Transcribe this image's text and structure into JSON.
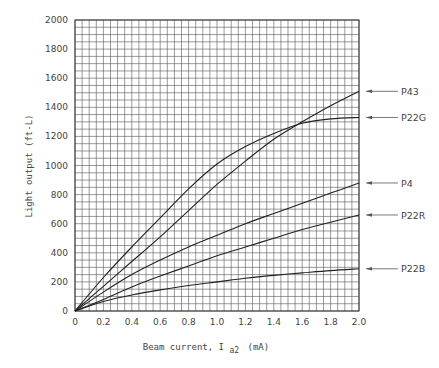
{
  "chart_data": {
    "type": "line",
    "title": "",
    "xlabel": "Beam current, I",
    "xlabel_sub": "a2",
    "xlabel_unit": "(mA)",
    "ylabel": "Light output (ft-L)",
    "xlim": [
      0,
      2.0
    ],
    "ylim": [
      0,
      2000
    ],
    "x_ticks": [
      "0",
      "0.2",
      "0.4",
      "0.6",
      "0.8",
      "1.0",
      "1.2",
      "1.4",
      "1.6",
      "1.8",
      "2.0"
    ],
    "y_ticks": [
      "0",
      "200",
      "400",
      "600",
      "800",
      "1000",
      "1200",
      "1400",
      "1600",
      "1800",
      "2000"
    ],
    "grid": true,
    "grid_step_x": 0.05,
    "grid_step_y": 50,
    "legend_position": "right, arrow labels",
    "x": [
      0,
      0.2,
      0.4,
      0.6,
      0.8,
      1.0,
      1.2,
      1.4,
      1.6,
      1.8,
      2.0
    ],
    "series": [
      {
        "name": "P43",
        "values": [
          0,
          170,
          340,
          510,
          690,
          870,
          1030,
          1180,
          1300,
          1410,
          1510
        ]
      },
      {
        "name": "P22G",
        "values": [
          0,
          230,
          440,
          640,
          840,
          1010,
          1130,
          1220,
          1290,
          1320,
          1330
        ]
      },
      {
        "name": "P4",
        "values": [
          0,
          130,
          250,
          350,
          440,
          520,
          600,
          670,
          740,
          810,
          880
        ]
      },
      {
        "name": "P22R",
        "values": [
          0,
          80,
          165,
          240,
          310,
          380,
          440,
          500,
          560,
          610,
          660
        ]
      },
      {
        "name": "P22B",
        "values": [
          0,
          65,
          110,
          145,
          175,
          200,
          225,
          245,
          262,
          278,
          290
        ]
      }
    ]
  },
  "legend": [
    {
      "label": "P43",
      "value_at_end": 1510
    },
    {
      "label": "P22G",
      "value_at_end": 1330
    },
    {
      "label": "P4",
      "value_at_end": 880
    },
    {
      "label": "P22R",
      "value_at_end": 660
    },
    {
      "label": "P22B",
      "value_at_end": 290
    }
  ],
  "axes": {
    "ylabel": "Light output (ft-L)",
    "xlabel_main": "Beam current, I",
    "xlabel_sub": "a2",
    "xlabel_unit": "(mA)"
  }
}
